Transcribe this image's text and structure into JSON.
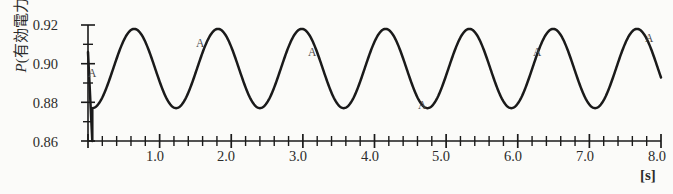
{
  "chart_data": {
    "type": "line",
    "title": "",
    "ylabel": "P (有効電力) [p.u]",
    "ylabel_symbol": "P",
    "ylabel_text": "(有効電力)",
    "ylabel_unit": "[p.u]",
    "xlabel": "",
    "xunit": "[s]",
    "xlim": [
      0.0,
      8.0
    ],
    "ylim": [
      0.86,
      0.92
    ],
    "ytick_labels": [
      "0.92",
      "0.90",
      "0.88",
      "0.86"
    ],
    "ytick_values": [
      0.92,
      0.9,
      0.88,
      0.86
    ],
    "yminor_step": 0.005,
    "xtick_labels": [
      "1.0",
      "2.0",
      "3.0",
      "4.0",
      "5.0",
      "6.0",
      "7.0",
      "8.0"
    ],
    "xtick_values": [
      1.0,
      2.0,
      3.0,
      4.0,
      5.0,
      6.0,
      7.0,
      8.0
    ],
    "xminor_step": 0.2,
    "grid": false,
    "legend": "none",
    "line_color": "#1a1a1a",
    "background_color": "#fbfbf9",
    "series": [
      {
        "name": "P",
        "description": "undamped sustained oscillation, initial dip then constant-amplitude swing",
        "initial_value": 0.906,
        "dip_min": 0.86,
        "dip_time": 0.06,
        "steady_mean": 0.8975,
        "amplitude": 0.0205,
        "period": 1.17,
        "frequency_hz": 0.855,
        "peak_value": 0.918,
        "trough_value": 0.877,
        "peak_times": [
          0.37,
          1.54,
          2.71,
          3.88,
          5.05,
          6.22,
          7.39
        ],
        "trough_times": [
          0.96,
          2.13,
          3.3,
          4.47,
          5.64,
          6.81,
          7.98
        ]
      }
    ],
    "annotations": [
      {
        "label": "A",
        "x_px": 88,
        "y_px": 68
      },
      {
        "label": "A",
        "x_px": 196,
        "y_px": 38
      },
      {
        "label": "A",
        "x_px": 308,
        "y_px": 47
      },
      {
        "label": "A",
        "x_px": 418,
        "y_px": 100
      },
      {
        "label": "A",
        "x_px": 533,
        "y_px": 47
      },
      {
        "label": "A",
        "x_px": 645,
        "y_px": 33
      }
    ]
  }
}
